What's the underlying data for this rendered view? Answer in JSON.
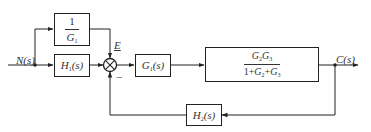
{
  "diagram": {
    "title": "",
    "signals": {
      "input": "N(s)",
      "error": "E",
      "output": "C(s)"
    },
    "blocks": {
      "feedforward": {
        "num": "1",
        "den_base": "G",
        "den_sub": "1"
      },
      "h1": {
        "base": "H",
        "sub": "1",
        "arg": "(s)"
      },
      "g1": {
        "base": "G",
        "sub": "1",
        "arg": "(s)"
      },
      "plant": {
        "num_a": "G",
        "num_a_sub": "2",
        "num_b": "G",
        "num_b_sub": "3",
        "den_one": "1+",
        "den_a": "G",
        "den_a_sub": "2",
        "den_plus": "+",
        "den_b": "G",
        "den_b_sub": "3"
      },
      "h2": {
        "base": "H",
        "sub": "2",
        "arg": "(s)"
      }
    },
    "summing_junction": {
      "feedback_sign": "−"
    },
    "colors": {
      "line": "#222222",
      "text": "#333333",
      "background": "#ffffff"
    }
  }
}
